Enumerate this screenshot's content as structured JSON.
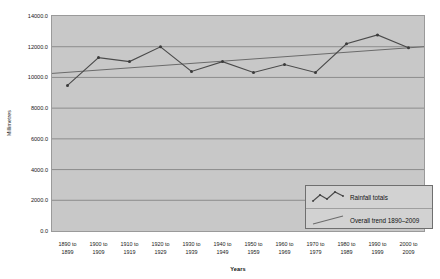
{
  "chart_data": {
    "type": "line",
    "title": "",
    "xlabel": "Years",
    "ylabel": "Millimetres",
    "ylim": [
      0,
      14000
    ],
    "ytick_step": 2000,
    "ytick_labels": [
      "0.0",
      "2000.0",
      "4000.0",
      "6000.0",
      "8000.0",
      "10000.0",
      "12000.0",
      "14000.0"
    ],
    "ytick_values": [
      0,
      2000,
      4000,
      6000,
      8000,
      10000,
      12000,
      14000
    ],
    "grid": "horizontal",
    "legend_position": "inside-bottom-right",
    "categories": [
      "1890 to 1899",
      "1900 to 1909",
      "1910 to 1919",
      "1920 to 1929",
      "1930 to 1939",
      "1940 to 1949",
      "1950 to 1959",
      "1960 to 1969",
      "1970 to 1979",
      "1980 to 1989",
      "1990 to 1999",
      "2000 to 2009"
    ],
    "category_lines": [
      [
        "1890 to",
        "1899"
      ],
      [
        "1900 to",
        "1909"
      ],
      [
        "1910 to",
        "1919"
      ],
      [
        "1920 to",
        "1929"
      ],
      [
        "1930 to",
        "1939"
      ],
      [
        "1940 to",
        "1949"
      ],
      [
        "1950 to",
        "1959"
      ],
      [
        "1960 to",
        "1969"
      ],
      [
        "1970 to",
        "1979"
      ],
      [
        "1980 to",
        "1989"
      ],
      [
        "1990 to",
        "1999"
      ],
      [
        "2000 to",
        "2009"
      ]
    ],
    "series": [
      {
        "name": "Rainfall totals",
        "type": "line-markers",
        "color": "#4a4a4a",
        "values": [
          9480,
          11290,
          11030,
          11990,
          10390,
          11030,
          10320,
          10840,
          10320,
          12190,
          12770,
          11940
        ]
      },
      {
        "name": "Overall trend 1890–2009",
        "type": "trend-line",
        "color": "#6b6b6b",
        "endpoints": [
          10260,
          12000
        ]
      }
    ],
    "legend": [
      {
        "label": "Rainfall totals",
        "swatch": "zigzag-line-with-markers"
      },
      {
        "label": "Overall trend 1890–2009",
        "swatch": "straight-line"
      }
    ],
    "colors": {
      "plot_background": "#c8c8c8",
      "gridline": "#7d7d7d",
      "axis": "#555555",
      "series_line": "#4a4a4a",
      "trend_line": "#6b6b6b",
      "legend_background": "#d2d2d2",
      "page_background": "#ffffff"
    }
  }
}
